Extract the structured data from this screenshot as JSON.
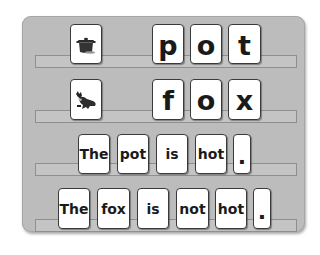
{
  "board": {
    "rows": [
      {
        "picture": "pot-picture",
        "letters": [
          "p",
          "o",
          "t"
        ]
      },
      {
        "picture": "fox-picture",
        "letters": [
          "f",
          "o",
          "x"
        ]
      },
      {
        "sentence": [
          "The",
          "pot",
          "is",
          "hot",
          "."
        ]
      },
      {
        "sentence": [
          "The",
          "fox",
          "is",
          "not",
          "hot",
          "."
        ]
      }
    ]
  },
  "colors": {
    "panel": "#bcbcbc",
    "card": "#ffffff",
    "card_border": "#3a3a3a",
    "text": "#1a1a1a"
  }
}
